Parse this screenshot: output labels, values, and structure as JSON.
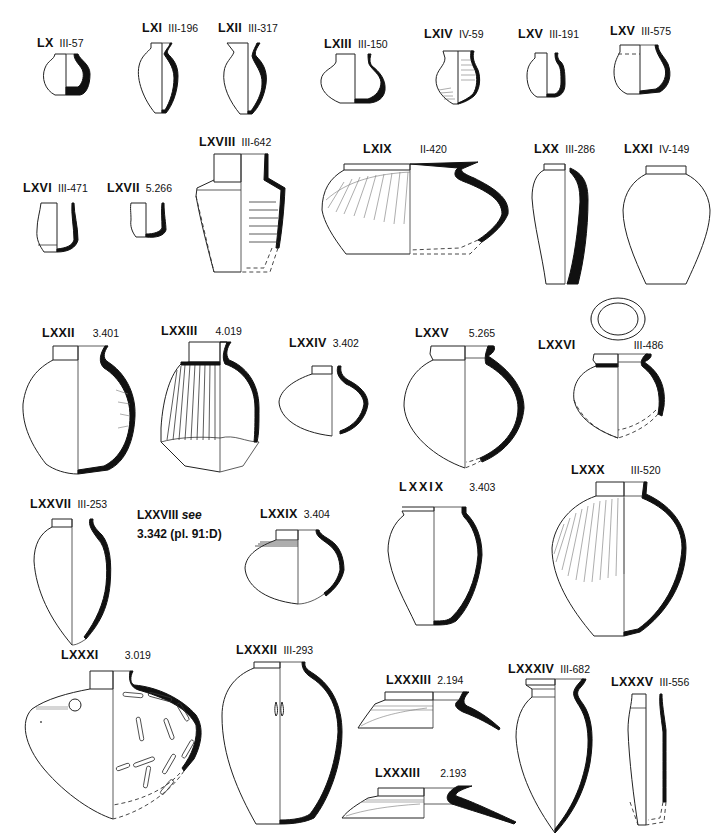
{
  "plate": {
    "title": "Pottery vessel types LX–LXXXV",
    "vessels": [
      {
        "id": "LX",
        "reg": "III-57"
      },
      {
        "id": "LXI",
        "reg": "III-196"
      },
      {
        "id": "LXII",
        "reg": "III-317"
      },
      {
        "id": "LXIII",
        "reg": "III-150"
      },
      {
        "id": "LXIV",
        "reg": "IV-59"
      },
      {
        "id": "LXV",
        "reg": "III-191"
      },
      {
        "id": "LXV",
        "reg": "III-575"
      },
      {
        "id": "LXVI",
        "reg": "III-471"
      },
      {
        "id": "LXVII",
        "reg": "5.266"
      },
      {
        "id": "LXVIII",
        "reg": "III-642"
      },
      {
        "id": "LXIX",
        "reg": "II-420"
      },
      {
        "id": "LXX",
        "reg": "III-286"
      },
      {
        "id": "LXXI",
        "reg": "IV-149"
      },
      {
        "id": "LXXII",
        "reg": "3.401"
      },
      {
        "id": "LXXIII",
        "reg": "4.019"
      },
      {
        "id": "LXXIV",
        "reg": "3.402"
      },
      {
        "id": "LXXV",
        "reg": "5.265"
      },
      {
        "id": "LXXVI",
        "reg": "III-486"
      },
      {
        "id": "LXXVII",
        "reg": "III-253"
      },
      {
        "id": "LXXIX",
        "reg": "3.404"
      },
      {
        "id": "LXXIX",
        "reg": "3.403"
      },
      {
        "id": "LXXX",
        "reg": "III-520"
      },
      {
        "id": "LXXXI",
        "reg": "3.019"
      },
      {
        "id": "LXXXII",
        "reg": "III-293"
      },
      {
        "id": "LXXXIII",
        "reg": "2.194"
      },
      {
        "id": "LXXXIII",
        "reg": "2.193"
      },
      {
        "id": "LXXXIV",
        "reg": "III-682"
      },
      {
        "id": "LXXXV",
        "reg": "III-556"
      }
    ],
    "note": {
      "line1_id": "LXXVIII",
      "line1_see": "see",
      "line2": "3.342 (pl. 91:D)"
    }
  }
}
